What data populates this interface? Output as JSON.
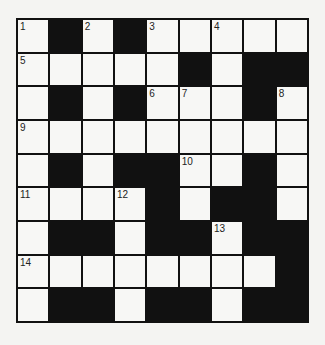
{
  "puzzle": {
    "rows": 9,
    "cols": 9,
    "layout": [
      "W.W.WWWWW",
      "WWWWW.W..",
      "W.W.WWW.W",
      "WWWWWWWWW",
      "W.W..WW.W",
      "WWWW.W..W",
      "W..W..W..",
      "WWWWWWWW.",
      "W..W..W.."
    ],
    "numbers": {
      "0,0": "1",
      "0,2": "2",
      "0,4": "3",
      "0,6": "4",
      "1,0": "5",
      "2,4": "6",
      "2,5": "7",
      "2,8": "8",
      "3,0": "9",
      "4,5": "10",
      "5,0": "11",
      "5,3": "12",
      "6,6": "13",
      "7,0": "14"
    },
    "colors": {
      "black": "#111111",
      "white": "#f7f7f5"
    }
  }
}
